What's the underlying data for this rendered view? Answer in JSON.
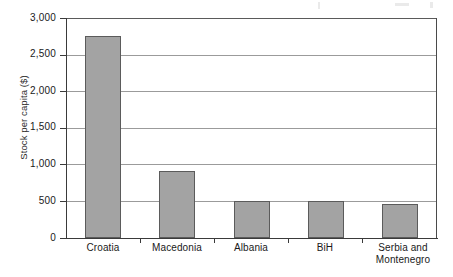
{
  "chart_data": {
    "type": "bar",
    "title": "",
    "subtitle": "",
    "xlabel": "",
    "ylabel": "Stock per capita ($)",
    "categories": [
      "Croatia",
      "Macedonia",
      "Albania",
      "BiH",
      "Serbia and Montenegro"
    ],
    "category_lines": [
      [
        "Croatia"
      ],
      [
        "Macedonia"
      ],
      [
        "Albania"
      ],
      [
        "BiH"
      ],
      [
        "Serbia and",
        "Montenegro"
      ]
    ],
    "values": [
      2750,
      920,
      500,
      500,
      465
    ],
    "ylim": [
      0,
      3000
    ],
    "yticks": [
      0,
      500,
      1000,
      1500,
      2000,
      2500,
      3000
    ],
    "ytick_labels": [
      "0",
      "500",
      "1,000",
      "1,500",
      "2,000",
      "2,500",
      "3,000"
    ],
    "grid": true,
    "grid_axis": "y",
    "legend": false,
    "legend_position": "none",
    "bar_fill_color": "#a3a3a3",
    "bar_edge_color": "#5b5b5b",
    "gridline_color": "#9b9b9b",
    "axis_color": "#3a3a3a",
    "background_color": "#ffffff"
  }
}
